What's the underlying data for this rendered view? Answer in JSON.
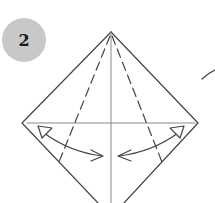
{
  "diagram": {
    "type": "origami-step",
    "step_number": "2",
    "badge_color": "#c8c8c8",
    "line_color": "#444444",
    "elements": {
      "apex": [
        111,
        32
      ],
      "left_corner": [
        22,
        123
      ],
      "right_corner": [
        198,
        123
      ],
      "center_crease": "vertical",
      "horizontal_crease": "y=123",
      "dashed_fold_lines": 2,
      "fold_unfold_arrows": 2
    }
  }
}
